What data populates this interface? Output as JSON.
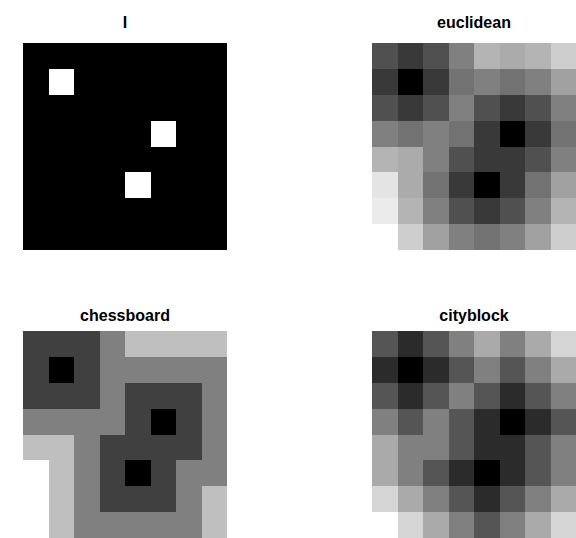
{
  "chart_data": [
    {
      "type": "heatmap",
      "title": "I",
      "colormap": "gray",
      "rows": 8,
      "cols": 8,
      "max": 1,
      "values": [
        [
          0,
          0,
          0,
          0,
          0,
          0,
          0,
          0
        ],
        [
          0,
          1,
          0,
          0,
          0,
          0,
          0,
          0
        ],
        [
          0,
          0,
          0,
          0,
          0,
          0,
          0,
          0
        ],
        [
          0,
          0,
          0,
          0,
          0,
          1,
          0,
          0
        ],
        [
          0,
          0,
          0,
          0,
          0,
          0,
          0,
          0
        ],
        [
          0,
          0,
          0,
          0,
          1,
          0,
          0,
          0
        ],
        [
          0,
          0,
          0,
          0,
          0,
          0,
          0,
          0
        ],
        [
          0,
          0,
          0,
          0,
          0,
          0,
          0,
          0
        ]
      ]
    },
    {
      "type": "heatmap",
      "title": "euclidean",
      "colormap": "gray",
      "rows": 8,
      "cols": 8,
      "max": 4.47,
      "values": [
        [
          1.41,
          1,
          1.41,
          2.24,
          3.16,
          3,
          3.16,
          3.61
        ],
        [
          1,
          0,
          1,
          2,
          2.24,
          2,
          2.24,
          2.83
        ],
        [
          1.41,
          1,
          1.41,
          2.24,
          1.41,
          1,
          1.41,
          2.24
        ],
        [
          2.24,
          2,
          2.24,
          2,
          1,
          0,
          1,
          2
        ],
        [
          3.16,
          3,
          2.24,
          1.41,
          1,
          1,
          1.41,
          2.24
        ],
        [
          4,
          3,
          2,
          1,
          0,
          1,
          2,
          2.83
        ],
        [
          4.12,
          3.16,
          2.24,
          1.41,
          1,
          1.41,
          2.24,
          3.16
        ],
        [
          4.47,
          3.61,
          2.83,
          2.24,
          2,
          2.24,
          2.83,
          3.61
        ]
      ]
    },
    {
      "type": "heatmap",
      "title": "chessboard",
      "colormap": "gray",
      "rows": 8,
      "cols": 8,
      "max": 4,
      "values": [
        [
          1,
          1,
          1,
          2,
          3,
          3,
          3,
          3
        ],
        [
          1,
          0,
          1,
          2,
          2,
          2,
          2,
          2
        ],
        [
          1,
          1,
          1,
          2,
          1,
          1,
          1,
          2
        ],
        [
          2,
          2,
          2,
          2,
          1,
          0,
          1,
          2
        ],
        [
          3,
          3,
          2,
          1,
          1,
          1,
          1,
          2
        ],
        [
          4,
          3,
          2,
          1,
          0,
          1,
          2,
          2
        ],
        [
          4,
          3,
          2,
          1,
          1,
          1,
          2,
          3
        ],
        [
          4,
          3,
          2,
          2,
          2,
          2,
          2,
          3
        ]
      ]
    },
    {
      "type": "heatmap",
      "title": "cityblock",
      "colormap": "gray",
      "rows": 8,
      "cols": 8,
      "max": 6,
      "values": [
        [
          2,
          1,
          2,
          3,
          4,
          3,
          4,
          5
        ],
        [
          1,
          0,
          1,
          2,
          3,
          2,
          3,
          4
        ],
        [
          2,
          1,
          2,
          3,
          2,
          1,
          2,
          3
        ],
        [
          3,
          2,
          3,
          2,
          1,
          0,
          1,
          2
        ],
        [
          4,
          3,
          3,
          2,
          1,
          1,
          2,
          3
        ],
        [
          4,
          3,
          2,
          1,
          0,
          1,
          2,
          3
        ],
        [
          5,
          4,
          3,
          2,
          1,
          2,
          3,
          4
        ],
        [
          6,
          5,
          4,
          3,
          2,
          3,
          4,
          5
        ]
      ]
    }
  ]
}
